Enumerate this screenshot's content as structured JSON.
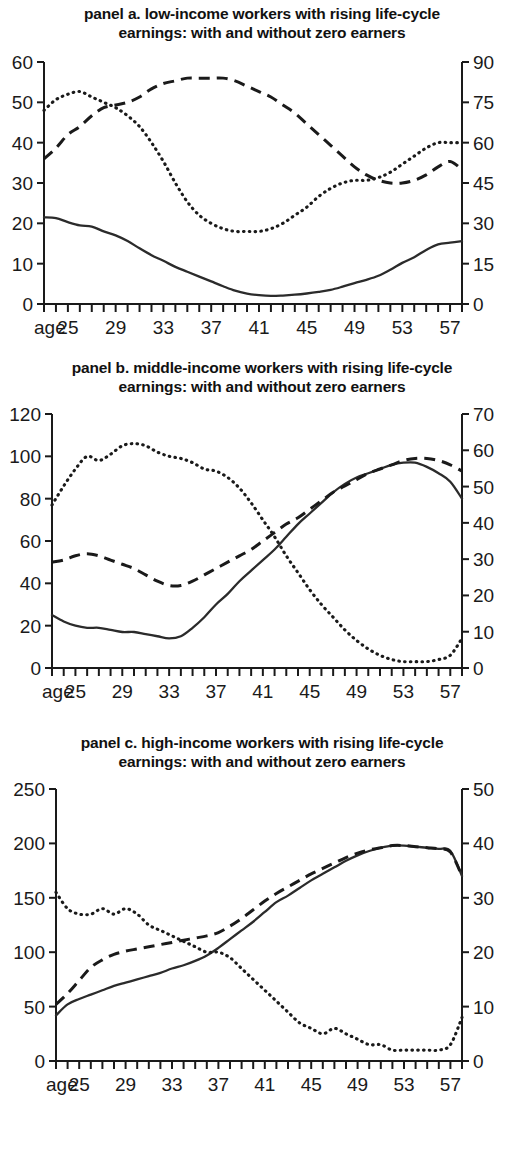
{
  "chart_data": [
    {
      "type": "line",
      "panel_id": "a",
      "title": "panel a. low-income workers with rising life-cycle earnings: with and without zero earners",
      "title_line1": "panel a. low-income workers with rising life-cycle",
      "title_line2": "earnings: with and without zero earners",
      "xlabel": "age",
      "x_axis_label": "age",
      "xlim": [
        23,
        58
      ],
      "x_tick_labels": [
        "25",
        "29",
        "33",
        "37",
        "41",
        "45",
        "49",
        "53",
        "57"
      ],
      "x_tick_values": [
        25,
        29,
        33,
        37,
        41,
        45,
        49,
        53,
        57
      ],
      "x_minor_ticks_every": 1,
      "left_axis": {
        "ylim": [
          0,
          60
        ],
        "ticks": [
          0,
          10,
          20,
          30,
          40,
          50,
          60
        ]
      },
      "right_axis": {
        "ylim": [
          0,
          90
        ],
        "ticks": [
          0,
          15,
          30,
          45,
          60,
          75,
          90
        ]
      },
      "grid": false,
      "legend": "none",
      "x": [
        23,
        24,
        25,
        26,
        27,
        28,
        29,
        30,
        31,
        32,
        33,
        34,
        35,
        36,
        37,
        38,
        39,
        40,
        41,
        42,
        43,
        44,
        45,
        46,
        47,
        48,
        49,
        50,
        51,
        52,
        53,
        54,
        55,
        56,
        57,
        58
      ],
      "series": [
        {
          "name": "solid-line",
          "style": "solid",
          "axis": "left",
          "values": [
            21.5,
            21.3,
            20.3,
            19.5,
            19.2,
            18.0,
            17.0,
            15.6,
            13.8,
            12.1,
            10.7,
            9.2,
            8.0,
            6.8,
            5.6,
            4.4,
            3.3,
            2.6,
            2.2,
            2.0,
            2.1,
            2.3,
            2.6,
            3.0,
            3.5,
            4.3,
            5.2,
            6.0,
            7.0,
            8.5,
            10.2,
            11.6,
            13.4,
            14.8,
            15.2,
            15.6
          ]
        },
        {
          "name": "dashed-line",
          "style": "dashed",
          "axis": "right",
          "values": [
            54,
            58,
            63,
            66,
            70,
            73,
            74,
            75,
            77,
            80,
            82,
            83,
            84,
            84,
            84,
            84,
            83,
            81,
            79,
            77,
            74,
            71,
            67,
            63,
            59,
            55,
            51,
            48,
            46,
            45,
            45,
            46,
            48,
            51,
            53,
            50
          ]
        },
        {
          "name": "dotted-line",
          "style": "dotted",
          "axis": "right",
          "values": [
            72,
            76,
            78,
            79,
            77,
            75,
            73,
            70,
            66,
            60,
            53,
            45,
            38,
            33,
            30,
            28,
            27,
            27,
            27,
            28,
            30,
            33,
            36,
            40,
            43,
            45,
            46,
            46,
            47,
            49,
            52,
            55,
            58,
            60,
            60,
            60
          ]
        }
      ]
    },
    {
      "type": "line",
      "panel_id": "b",
      "title": "panel b. middle-income workers with rising life-cycle earnings: with and without zero earners",
      "title_line1": "panel b. middle-income workers with rising life-cycle",
      "title_line2": "earnings: with and without zero earners",
      "xlabel": "age",
      "x_axis_label": "age",
      "xlim": [
        23,
        58
      ],
      "x_tick_labels": [
        "25",
        "29",
        "33",
        "37",
        "41",
        "45",
        "49",
        "53",
        "57"
      ],
      "x_tick_values": [
        25,
        29,
        33,
        37,
        41,
        45,
        49,
        53,
        57
      ],
      "x_minor_ticks_every": 1,
      "left_axis": {
        "ylim": [
          0,
          120
        ],
        "ticks": [
          0,
          20,
          40,
          60,
          80,
          100,
          120
        ]
      },
      "right_axis": {
        "ylim": [
          0,
          70
        ],
        "ticks": [
          0,
          10,
          20,
          30,
          40,
          50,
          60,
          70
        ]
      },
      "grid": false,
      "legend": "none",
      "x": [
        23,
        24,
        25,
        26,
        27,
        28,
        29,
        30,
        31,
        32,
        33,
        34,
        35,
        36,
        37,
        38,
        39,
        40,
        41,
        42,
        43,
        44,
        45,
        46,
        47,
        48,
        49,
        50,
        51,
        52,
        53,
        54,
        55,
        56,
        57,
        58
      ],
      "series": [
        {
          "name": "solid-line",
          "style": "solid",
          "axis": "left",
          "values": [
            25,
            22,
            20,
            19,
            19,
            18,
            17,
            17,
            16,
            15,
            14,
            15,
            19,
            24,
            30,
            35,
            41,
            46,
            51,
            56,
            62,
            68,
            73,
            78,
            83,
            87,
            90,
            92,
            94,
            96,
            97,
            97,
            95,
            92,
            88,
            80
          ]
        },
        {
          "name": "dashed-line",
          "style": "dashed",
          "axis": "left",
          "values": [
            50,
            51,
            53,
            54,
            53,
            51,
            49,
            47,
            44,
            41,
            39,
            39,
            41,
            44,
            47,
            50,
            53,
            56,
            60,
            64,
            68,
            71,
            75,
            79,
            83,
            86,
            89,
            92,
            94,
            96,
            98,
            99,
            99,
            98,
            96,
            93
          ]
        },
        {
          "name": "dotted-line",
          "style": "dotted",
          "axis": "left",
          "values": [
            77,
            86,
            94,
            100,
            98,
            101,
            105,
            106,
            105,
            102,
            100,
            99,
            97,
            94,
            93,
            90,
            85,
            78,
            70,
            62,
            53,
            45,
            37,
            30,
            24,
            18,
            13,
            9,
            6,
            4,
            3,
            3,
            3,
            4,
            6,
            14
          ]
        }
      ]
    },
    {
      "type": "line",
      "panel_id": "c",
      "title": "panel c. high-income workers with rising life-cycle earnings: with and without zero earners",
      "title_line1": "panel c. high-income workers with rising life-cycle",
      "title_line2": "earnings: with and without zero earners",
      "xlabel": "age",
      "x_axis_label": "age",
      "xlim": [
        23,
        58
      ],
      "x_tick_labels": [
        "25",
        "29",
        "33",
        "37",
        "41",
        "45",
        "49",
        "53",
        "57"
      ],
      "x_tick_values": [
        25,
        29,
        33,
        37,
        41,
        45,
        49,
        53,
        57
      ],
      "x_minor_ticks_every": 1,
      "left_axis": {
        "ylim": [
          0,
          250
        ],
        "ticks": [
          0,
          50,
          100,
          150,
          200,
          250
        ]
      },
      "right_axis": {
        "ylim": [
          0,
          50
        ],
        "ticks": [
          0,
          10,
          20,
          30,
          40,
          50
        ]
      },
      "grid": false,
      "legend": "none",
      "x": [
        23,
        24,
        25,
        26,
        27,
        28,
        29,
        30,
        31,
        32,
        33,
        34,
        35,
        36,
        37,
        38,
        39,
        40,
        41,
        42,
        43,
        44,
        45,
        46,
        47,
        48,
        49,
        50,
        51,
        52,
        53,
        54,
        55,
        56,
        57,
        58
      ],
      "series": [
        {
          "name": "solid-line",
          "style": "solid",
          "axis": "left",
          "values": [
            42,
            52,
            57,
            61,
            65,
            69,
            72,
            75,
            78,
            81,
            85,
            88,
            92,
            97,
            104,
            112,
            120,
            128,
            137,
            146,
            152,
            159,
            166,
            172,
            178,
            184,
            189,
            193,
            196,
            198,
            198,
            197,
            196,
            195,
            193,
            170
          ]
        },
        {
          "name": "dashed-line",
          "style": "dashed",
          "axis": "left",
          "values": [
            52,
            62,
            74,
            86,
            93,
            98,
            101,
            103,
            105,
            107,
            109,
            111,
            113,
            115,
            118,
            124,
            131,
            139,
            147,
            154,
            160,
            166,
            172,
            177,
            182,
            187,
            191,
            194,
            196,
            198,
            198,
            197,
            196,
            195,
            192,
            170
          ]
        },
        {
          "name": "dotted-line",
          "style": "dotted",
          "axis": "right",
          "values": [
            31,
            28,
            27,
            27,
            28,
            27,
            28,
            27,
            25,
            24,
            23,
            22,
            21,
            20,
            20,
            19,
            17,
            15,
            13,
            11,
            9,
            7,
            6,
            5,
            6,
            5,
            4,
            3,
            3,
            2,
            2,
            2,
            2,
            2,
            3,
            8
          ]
        }
      ]
    }
  ]
}
